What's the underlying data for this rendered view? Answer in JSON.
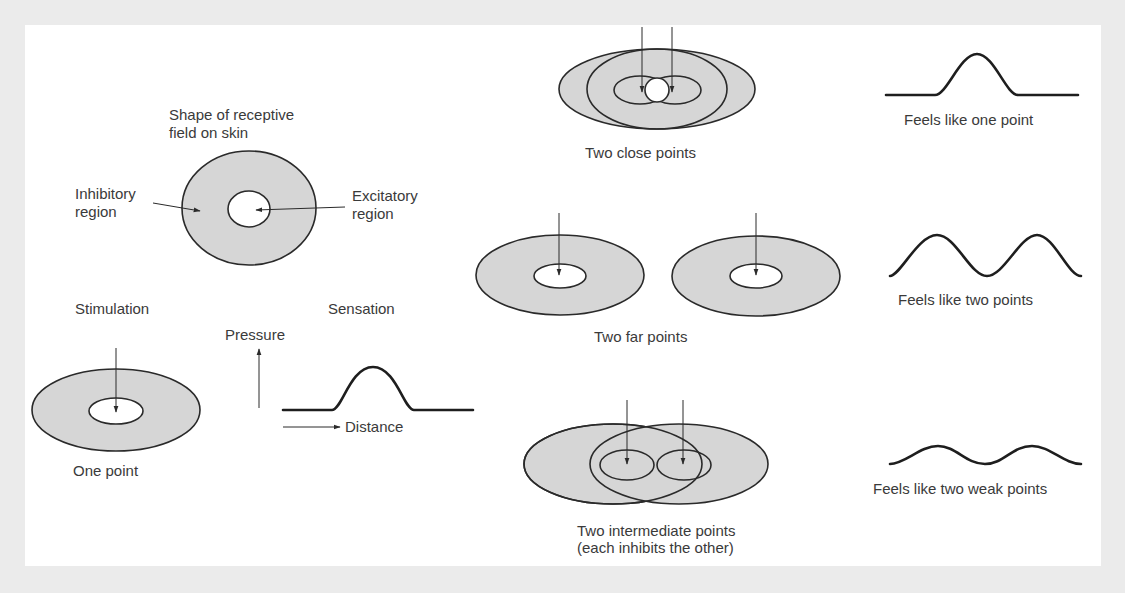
{
  "figure": {
    "colors": {
      "background": "#ebebeb",
      "panel": "#ffffff",
      "inhibitory_fill": "#d6d6d6",
      "excitatory_fill": "#ffffff",
      "stroke": "#2a2a2a",
      "text": "#3a3a3a"
    }
  },
  "receptive_field": {
    "title_line1": "Shape of receptive",
    "title_line2": "field on skin",
    "inhibitory_label_line1": "Inhibitory",
    "inhibitory_label_line2": "region",
    "excitatory_label_line1": "Excitatory",
    "excitatory_label_line2": "region"
  },
  "one_point": {
    "stimulation_heading": "Stimulation",
    "sensation_heading": "Sensation",
    "y_axis_label": "Pressure",
    "x_axis_label": "Distance",
    "caption": "One point"
  },
  "cases": [
    {
      "id": "close",
      "caption": "Two close points",
      "sensation": "Feels like one point"
    },
    {
      "id": "far",
      "caption": "Two far points",
      "sensation": "Feels like two points"
    },
    {
      "id": "intermediate",
      "caption_line1": "Two intermediate points",
      "caption_line2": "(each inhibits the other)",
      "sensation": "Feels like two weak points"
    }
  ]
}
